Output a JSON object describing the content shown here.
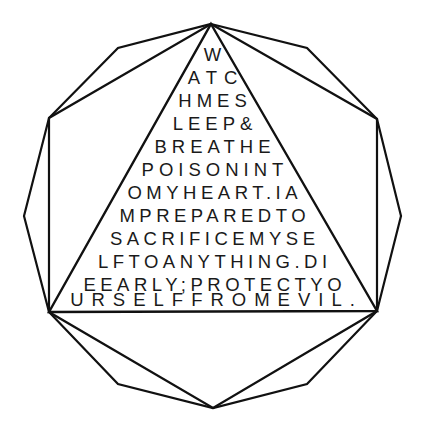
{
  "figure": {
    "shape": "decagon-with-inscribed-hexagon-and-triangle",
    "stroke_color": "#111111",
    "background_color": "#ffffff",
    "outer_polygon": [
      [
        211,
        24
      ],
      [
        307,
        48
      ],
      [
        377,
        119
      ],
      [
        401,
        216
      ],
      [
        377,
        311
      ],
      [
        307,
        384
      ],
      [
        213,
        408
      ],
      [
        118,
        384
      ],
      [
        49,
        312
      ],
      [
        24,
        216
      ],
      [
        49,
        118
      ],
      [
        118,
        48
      ]
    ],
    "inner_hexagon": [
      [
        211,
        24
      ],
      [
        377,
        119
      ],
      [
        377,
        311
      ],
      [
        213,
        408
      ],
      [
        49,
        312
      ],
      [
        49,
        118
      ]
    ],
    "triangle": [
      [
        211,
        24
      ],
      [
        377,
        311
      ],
      [
        49,
        312
      ]
    ],
    "text_lines": [
      {
        "text": "W",
        "y": 45,
        "spacing": 4
      },
      {
        "text": "ATC",
        "y": 68,
        "spacing": 7
      },
      {
        "text": "HMES",
        "y": 91,
        "spacing": 5
      },
      {
        "text": "LEEP&",
        "y": 114,
        "spacing": 5
      },
      {
        "text": "BREATHE",
        "y": 137,
        "spacing": 5
      },
      {
        "text": "POISONINT",
        "y": 160,
        "spacing": 5
      },
      {
        "text": "OMYHEART.IA",
        "y": 183,
        "spacing": 4.5
      },
      {
        "text": "MPREPAREDTO",
        "y": 206,
        "spacing": 4.5
      },
      {
        "text": "SACRIFICEMYSE",
        "y": 229,
        "spacing": 4.5
      },
      {
        "text": "LFTOANYTHING.DI",
        "y": 252,
        "spacing": 4.5
      },
      {
        "text": "EEARLY;PROTECTYO",
        "y": 275,
        "spacing": 4.5
      },
      {
        "text": "URSELFFROMEVIL.",
        "y": 290,
        "spacing": 8
      }
    ]
  }
}
